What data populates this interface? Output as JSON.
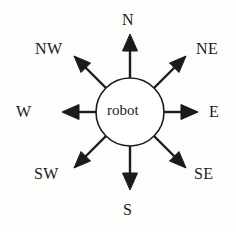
{
  "diagram": {
    "center": {
      "label": "robot",
      "shape": "circle",
      "cx": 130,
      "cy": 112,
      "r": 34,
      "stroke": "#1b1b1b",
      "fill": "#ffffff",
      "stroke_width": 1.6
    },
    "background_color": "#fdfdfc",
    "ink_color": "#1b1b1b",
    "arrow_count": 8,
    "directions": [
      {
        "key": "n",
        "label": "N",
        "angle_deg": 90,
        "tip_x": 130,
        "tip_y": 35
      },
      {
        "key": "ne",
        "label": "NE",
        "angle_deg": 45,
        "tip_x": 185,
        "tip_y": 57
      },
      {
        "key": "e",
        "label": "E",
        "angle_deg": 0,
        "tip_x": 197,
        "tip_y": 112
      },
      {
        "key": "se",
        "label": "SE",
        "angle_deg": -45,
        "tip_x": 185,
        "tip_y": 167
      },
      {
        "key": "s",
        "label": "S",
        "angle_deg": -90,
        "tip_x": 130,
        "tip_y": 189
      },
      {
        "key": "sw",
        "label": "SW",
        "angle_deg": -135,
        "tip_x": 75,
        "tip_y": 167
      },
      {
        "key": "w",
        "label": "W",
        "angle_deg": 180,
        "tip_x": 62,
        "tip_y": 112
      },
      {
        "key": "nw",
        "label": "NW",
        "angle_deg": 135,
        "tip_x": 75,
        "tip_y": 57
      }
    ]
  }
}
